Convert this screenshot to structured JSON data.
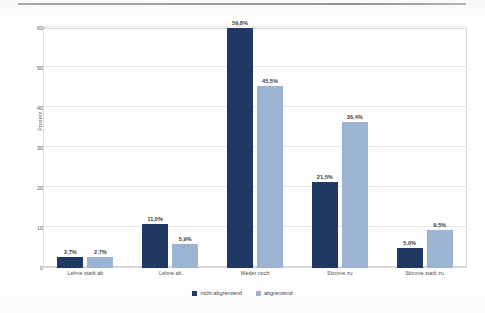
{
  "chart_data": {
    "type": "bar",
    "title": "",
    "xlabel": "",
    "ylabel": "Prozent",
    "ylim": [
      0,
      60
    ],
    "yticks": [
      0,
      10,
      20,
      30,
      40,
      50,
      60
    ],
    "ytick_labels": [
      "0",
      "10",
      "20",
      "30",
      "40",
      "50",
      "60"
    ],
    "grid": "horizontal",
    "legend_position": "bottom-center",
    "categories": [
      "Lehne stark ab",
      "Lehne ab",
      "Weder noch",
      "Stimme zu",
      "Stimme stark zu"
    ],
    "series": [
      {
        "name": "nicht-abgrenzend",
        "color": "#1f3864",
        "values": [
          2.7,
          11.0,
          59.8,
          21.5,
          5.0
        ],
        "labels": [
          "2,7%",
          "11,0%",
          "59,8%",
          "21,5%",
          "5,0%"
        ]
      },
      {
        "name": "abgrenzend",
        "color": "#9db3d4",
        "values": [
          2.7,
          5.9,
          45.5,
          36.4,
          9.5
        ],
        "labels": [
          "2,7%",
          "5,9%",
          "45,5%",
          "36,4%",
          "9,5%"
        ]
      }
    ]
  },
  "legend": {
    "items": [
      {
        "label": "nicht-abgrenzend",
        "color": "#1f3864"
      },
      {
        "label": "abgrenzend",
        "color": "#9db3d4"
      }
    ]
  },
  "axes": {
    "y_title": "Prozent"
  }
}
